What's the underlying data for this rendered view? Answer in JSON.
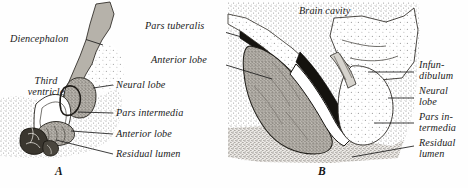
{
  "figure": {
    "panels": [
      {
        "id": "A",
        "id_label": "A",
        "labels": [
          {
            "name": "diencephalon",
            "text": "Diencephalon",
            "x": 10,
            "y": 34,
            "leader": [
              [
                86,
                40
              ],
              [
                104,
                46
              ]
            ]
          },
          {
            "name": "third-ventricle",
            "text": "Third\nventricle",
            "x": 14,
            "y": 82,
            "leader": []
          },
          {
            "name": "neural-lobe",
            "text": "Neural lobe",
            "x": 116,
            "y": 81,
            "leader": [
              [
                114,
                85
              ],
              [
                92,
                88
              ]
            ]
          },
          {
            "name": "pars-intermedia",
            "text": "Pars intermedia",
            "x": 116,
            "y": 110,
            "leader": [
              [
                114,
                113
              ],
              [
                76,
                113
              ]
            ]
          },
          {
            "name": "anterior-lobe",
            "text": "Anterior lobe",
            "x": 116,
            "y": 131,
            "leader": [
              [
                114,
                134
              ],
              [
                70,
                131
              ]
            ]
          },
          {
            "name": "residual-lumen",
            "text": "Residual lumen",
            "x": 116,
            "y": 152,
            "leader": [
              [
                114,
                154
              ],
              [
                58,
                139
              ]
            ]
          }
        ]
      },
      {
        "id": "B",
        "id_label": "B",
        "labels": [
          {
            "name": "pars-tuberalis",
            "text": "Pars tuberalis",
            "x": 146,
            "y": 26,
            "leader": [
              [
                214,
                30
              ],
              [
                244,
                38
              ]
            ]
          },
          {
            "name": "anterior-lobe-b",
            "text": "Anterior lobe",
            "x": 152,
            "y": 59,
            "leader": [
              [
                216,
                63
              ],
              [
                272,
                78
              ]
            ]
          },
          {
            "name": "brain-cavity",
            "text": "Brain cavity",
            "x": 300,
            "y": 10,
            "leader": []
          },
          {
            "name": "infundibulum",
            "text": "Infun-\ndibulum",
            "x": 418,
            "y": 63,
            "leader": [
              [
                368,
                72
              ],
              [
                414,
                72
              ]
            ]
          },
          {
            "name": "neural-lobe-b",
            "text": "Neural\nlobe",
            "x": 418,
            "y": 90,
            "leader": [
              [
                386,
                98
              ],
              [
                414,
                98
              ]
            ]
          },
          {
            "name": "pars-intermedia-b",
            "text": "Pars in-\ntermedia",
            "x": 418,
            "y": 116,
            "leader": [
              [
                374,
                123
              ],
              [
                414,
                123
              ]
            ]
          },
          {
            "name": "residual-lumen-b",
            "text": "Residual\nlumen",
            "x": 418,
            "y": 142,
            "leader": [
              [
                356,
                156
              ],
              [
                414,
                146
              ]
            ]
          }
        ]
      }
    ],
    "colors": {
      "ink": "#1b1b1b",
      "stipple": "#8d8d8d",
      "tissue_light": "#c9c6c0",
      "tissue_mid": "#a9a49c",
      "tissue_dark": "#2a2722",
      "lumen": "#ffffff",
      "paper": "#fefefe"
    }
  }
}
